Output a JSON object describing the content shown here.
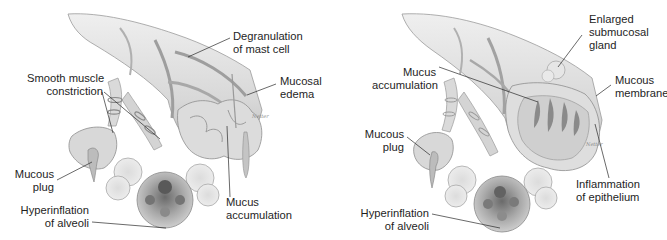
{
  "panels": [
    {
      "id": "left",
      "title": "Asthmatic airway — constricted bronchiole",
      "labels": {
        "degranulation": [
          "Degranulation",
          "of mast cell"
        ],
        "mucosal_edema": [
          "Mucosal",
          "edema"
        ],
        "smooth_muscle": [
          "Smooth muscle",
          "constriction"
        ],
        "mucous_plug": [
          "Mucous",
          "plug"
        ],
        "hyperinflation": [
          "Hyperinflation",
          "of alveoli"
        ],
        "mucus_accumulation": [
          "Mucus",
          "accumulation"
        ]
      }
    },
    {
      "id": "right",
      "title": "Asthmatic airway — mucus-filled bronchiole",
      "labels": {
        "enlarged_gland": [
          "Enlarged",
          "submucosal",
          "gland"
        ],
        "mucus_accumulation": [
          "Mucus",
          "accumulation"
        ],
        "mucous_membrane": [
          "Mucous",
          "membrane"
        ],
        "mucous_plug": [
          "Mucous",
          "plug"
        ],
        "inflammation": [
          "Inflammation",
          "of epithelium"
        ],
        "hyperinflation": [
          "Hyperinflation",
          "of alveoli"
        ]
      }
    }
  ],
  "colors": {
    "background": "#ffffff",
    "text": "#1e1e1e",
    "leader_line": "#2a2a2a",
    "tissue_light": "#e4e4e4",
    "tissue_mid": "#c9c9c9",
    "tissue_dark": "#8e8e8e",
    "alveoli_dark": "#555555"
  }
}
